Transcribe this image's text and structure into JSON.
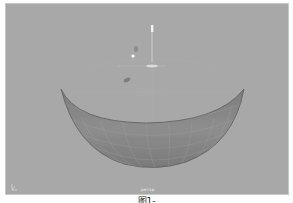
{
  "viewport": {
    "camera_label": "persp",
    "background_color": "#a8a8a8",
    "object": {
      "type": "hemisphere",
      "name": "bowl",
      "fill_color": "#8a8a8a",
      "wire_color": "#b0b0b0"
    },
    "gizmo": "move-manipulator",
    "axis_indicator": "xyz-axis"
  },
  "caption": "图1-"
}
